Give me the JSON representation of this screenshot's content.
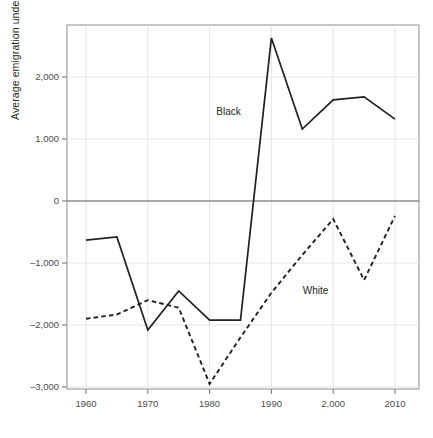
{
  "chart_data": {
    "type": "line",
    "title": "",
    "xlabel": "",
    "ylabel": "Average emigration underflow",
    "x": [
      1960,
      1965,
      1970,
      1975,
      1980,
      1985,
      1990,
      1995,
      2000,
      2005,
      2010
    ],
    "xlim": [
      1957,
      2012
    ],
    "ylim": [
      -3300,
      2800
    ],
    "xticks": [
      1960,
      1970,
      1980,
      1990,
      2000,
      2010
    ],
    "xtick_labels": [
      "1960",
      "1970",
      "1980",
      "1990",
      "2,000",
      "2010"
    ],
    "yticks": [
      2000,
      1000,
      0,
      -1000,
      -2000,
      -3000
    ],
    "ytick_labels": [
      "2,000",
      "1,000",
      "0",
      "–1,000",
      "–2,000",
      "–3,000"
    ],
    "grid": true,
    "legend_position": "inline-annotations",
    "zero_line": 0,
    "series": [
      {
        "name": "Black",
        "style": "solid",
        "color": "#231f20",
        "label_x": 1984,
        "label_y": 1420,
        "values": [
          -630,
          -580,
          -2080,
          -1450,
          -1920,
          -1920,
          2630,
          1160,
          1630,
          1680,
          1320
        ]
      },
      {
        "name": "White",
        "style": "dashed",
        "color": "#231f20",
        "label_x": 1998,
        "label_y": -1460,
        "values": [
          -1900,
          -1830,
          -1600,
          -1720,
          -2950,
          -2200,
          -1480,
          -870,
          -290,
          -1275,
          -240
        ]
      }
    ]
  }
}
